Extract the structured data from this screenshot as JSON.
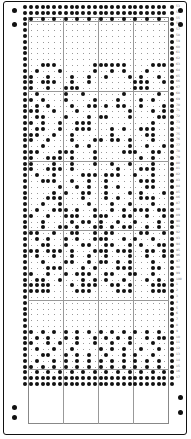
{
  "card": {
    "columns": 24,
    "pitch_x": 5.8,
    "pitch_y": 5.8,
    "origin_x": 31,
    "origin_y": 5,
    "hole_color": "#111111",
    "grid_color": "#999999",
    "row_numbers_start": 53
  },
  "rows": [
    "XXXXXXXXXXXXXXXXXXXXXXXX",
    "XXXXXXXXXXXXXXXXXXXXXXXX",
    "X.X.X.X.X.X.X.X.X.X.X.X.",
    "........................",
    "........................",
    "........................",
    "........................",
    "........................",
    "........................",
    "........................",
    "..XXX......XXXXXX....XXX",
    ".X...X.....X..X.X...X...",
    "X..X...X..X..X...X.X..X.",
    "X.XXX..X..X.......XXX..X",
    "X..X..XXX.........XXX...",
    ".X....X..X......X.....X.",
    "X.X...X....X...X...X.X..",
    ".X.X...X..XX.X.XX..X...X",
    "XX..X...X........X...X.X",
    ".XX...X...X.XX...X....XX",
    "X.X..X..XXX..........X..",
    ".XX..X..XXX...X.X..XXX..",
    "XX..X..X......X.....XX..",
    "X..X...X...XX.XX.X...X..",
    "..X.....X.X......X..X..X",
    "XX...XXX...X....XXX..XX.",
    "X..XXX.X...X.......X.X..",
    "X...X..X...X..X..X...X..",
    "X..XXX.X.......X...XXX..",
    ".X..X....XXX.XXX..X..X..",
    "..XXX..X..X..X.....XXX..",
    ".....X..X.X..X.X....XX..",
    "....X.X..XX..X...X.X...X",
    "...XXX...X...X.X...XXX..",
    "..X..X....X...X..X...X..",
    ".X..XXX.X..X..X.X.XXX.XX",
    "X..X..XXX..XXX..XX..X..X",
    "..X....X.XX.X..X..X...X.",
    "..X..XX.X..XX.X.XX..X.X.",
    "XX..X..XX..X.XX....XX..X",
    ".X.X..X.X..XXX..X.X..X..",
    "..XX..X..XX..XX..X.X..XX",
    "XX.XXX.X...XXX.XXX..XX.X",
    ".X..X..X..X..X...X..X..X",
    "..X...XX..X.XX.X.X...X..",
    "...XXX...X.X...XXX...XX.",
    "X..X..X.XXX..XX..XX..X..",
    ".XX..X...X.X.X..X...X.X.",
    "XXXX...X.XXX..XX.X...XXX",
    "XXXX....XXX....XXX...XXX",
    "........................",
    "........................",
    "........................",
    "........................",
    "........................",
    "........................",
    "X.X.X.X.X.X.X.X.X.X.X.X.",
    ".X.X..X.X..X.X.X.X..X.XX",
    "X..X.X..X..X..X..X...X..",
    ".X..X..X....X.X.X..X..X.",
    "..XX..X.X.X..X..X.X..X..",
    ".X..X.X.X.X.X.X.X.X.X.X.",
    "X.X.X.X.X.X.X.X.X.X.X.X.",
    ".X.X.X.X.X.X.X.X.X.X.X.X",
    "XXXXXXXXXXXXXXXXXXXXXXXX",
    "XXXXXXXXXXXXXXXXXXXXXXXX"
  ],
  "row_labels": [
    "53",
    "54",
    "55",
    "56",
    "57",
    "58",
    "59",
    "60",
    "61",
    "62",
    "63",
    "64",
    "65",
    "66",
    "67",
    "68",
    "69",
    "70",
    "71",
    "72",
    "73",
    "74",
    "75",
    "76",
    "77",
    "78",
    "79",
    "80",
    "81",
    "82",
    "83",
    "84",
    "85",
    "86",
    "87",
    "88",
    "89",
    "90",
    "91",
    "92",
    "93",
    "94",
    "95",
    "96",
    "97",
    "98",
    "99",
    "100",
    "1",
    "2",
    "3",
    "4",
    "5",
    "6",
    "7",
    "8",
    "9",
    "10",
    "11",
    "12",
    "13",
    "14",
    "15",
    "16",
    "17"
  ]
}
